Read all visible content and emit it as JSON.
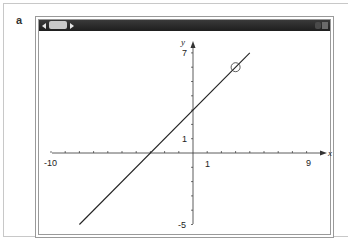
{
  "panel": {
    "label": "a"
  },
  "window": {
    "titlebar": {
      "scroll_left_icon": "triangle-left",
      "scroll_right_icon": "triangle-right",
      "buttons": [
        "minimize",
        "close"
      ]
    }
  },
  "chart_data": {
    "type": "line",
    "title": "",
    "xlabel": "x",
    "ylabel": "y",
    "xlim": [
      -10,
      9
    ],
    "ylim": [
      -5,
      7
    ],
    "x_tick_labels": [
      "-10",
      "1",
      "9"
    ],
    "y_tick_labels": [
      "7",
      "1",
      "-5"
    ],
    "x_ticks": [
      -10,
      -9,
      -8,
      -7,
      -6,
      -5,
      -4,
      -3,
      -2,
      -1,
      0,
      1,
      2,
      3,
      4,
      5,
      6,
      7,
      8,
      9
    ],
    "y_ticks": [
      -5,
      -4,
      -3,
      -2,
      -1,
      0,
      1,
      2,
      3,
      4,
      5,
      6,
      7
    ],
    "grid": false,
    "series": [
      {
        "name": "y = x + 3",
        "x": [
          -8,
          4
        ],
        "y": [
          -5,
          7
        ]
      }
    ],
    "annotations": [
      {
        "type": "open-circle",
        "x": 3,
        "y": 6
      }
    ]
  },
  "labels": {
    "x_axis": "x",
    "y_axis": "y",
    "x_min": "-10",
    "x_one": "1",
    "x_max": "9",
    "y_max": "7",
    "y_one": "1",
    "y_min": "-5"
  }
}
